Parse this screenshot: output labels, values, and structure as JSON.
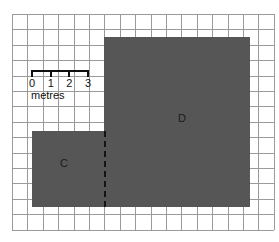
{
  "figure": {
    "background_color": "#ffffff"
  },
  "grid": {
    "line_color": "#9a9a9a",
    "cell_size_px": 15.4,
    "left_px": 12,
    "top_px": 14,
    "columns": 17,
    "rows": 14
  },
  "shapes": [
    {
      "id": "shape-c",
      "label": "C",
      "fill_color": "#565656",
      "x_px": 32,
      "y_px": 131,
      "width_px": 72,
      "height_px": 76,
      "width_cells": 4.7,
      "height_cells": 5,
      "label_x_px": 64,
      "label_y_px": 163
    },
    {
      "id": "shape-d",
      "label": "D",
      "fill_color": "#565656",
      "x_px": 104,
      "y_px": 37,
      "width_px": 146,
      "height_px": 170,
      "width_cells": 9.5,
      "height_cells": 11,
      "label_x_px": 182,
      "label_y_px": 118
    }
  ],
  "divider": {
    "name": "dashed-boundary",
    "color": "#141414",
    "x_px": 104,
    "y_top_px": 131,
    "y_bottom_px": 207,
    "style": "dashed"
  },
  "scale": {
    "caption": "metres",
    "tick_labels": [
      "0",
      "1",
      "2",
      "3"
    ],
    "bar_color": "#101010",
    "bar_x_px": 32,
    "bar_y_px": 70,
    "bar_length_px": 56,
    "tick_spacing_px": 18.7,
    "numbers_y_px": 78,
    "caption_x_px": 31,
    "caption_y_px": 90
  }
}
